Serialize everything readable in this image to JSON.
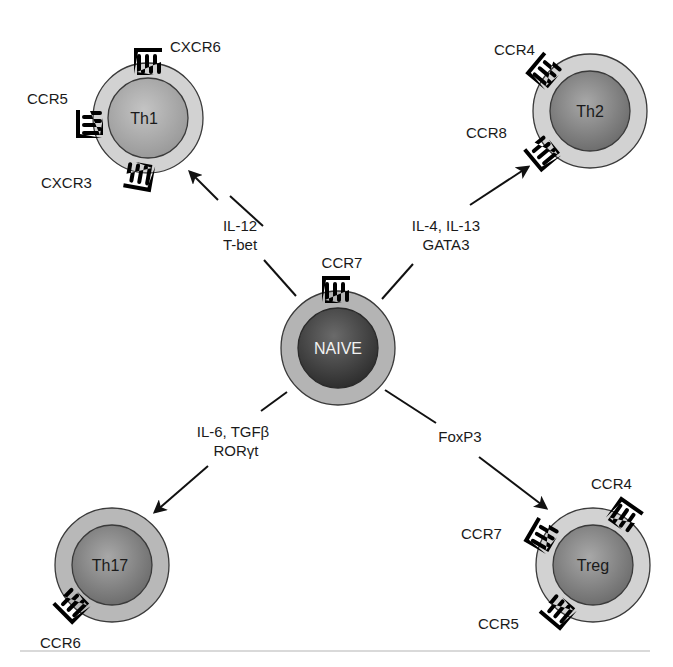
{
  "diagram": {
    "type": "T cell differentiation diagram",
    "colors": {
      "background": "#ffffff",
      "membrane": "#cfcfcf",
      "membrane_stroke": "#3a3a3a",
      "nucleus_light": "#a9a9a9",
      "nucleus_medium": "#8c8c8c",
      "nucleus_dark": "#3c3c3c",
      "arrow": "#111111"
    },
    "center_cell": {
      "name": "NAIVE",
      "receptors": [
        "CCR7"
      ]
    },
    "cells": [
      {
        "id": "th1",
        "name": "Th1",
        "receptors": [
          "CXCR6",
          "CCR5",
          "CXCR3"
        ],
        "arrow_label_lines": [
          "IL-12",
          "T-bet"
        ]
      },
      {
        "id": "th2",
        "name": "Th2",
        "receptors": [
          "CCR4",
          "CCR8"
        ],
        "arrow_label_lines": [
          "IL-4, IL-13",
          "GATA3"
        ]
      },
      {
        "id": "th17",
        "name": "Th17",
        "receptors": [
          "CCR6"
        ],
        "arrow_label_lines": [
          "IL-6, TGFβ",
          "RORγt"
        ]
      },
      {
        "id": "treg",
        "name": "Treg",
        "receptors": [
          "CCR4",
          "CCR7",
          "CCR5"
        ],
        "arrow_label_lines": [
          "FoxP3"
        ]
      }
    ]
  }
}
